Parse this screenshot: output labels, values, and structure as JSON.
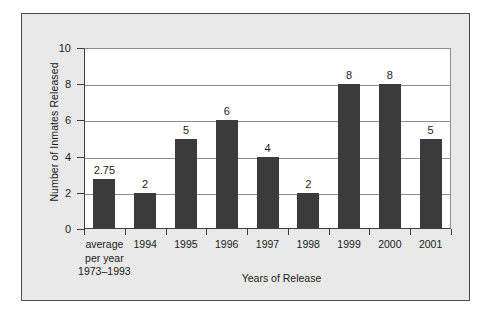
{
  "chart_data": {
    "type": "bar",
    "title": "",
    "xlabel": "Years of Release",
    "ylabel": "Number of Inmates Released",
    "categories": [
      "average\nper year\n1973–1993",
      "1994",
      "1995",
      "1996",
      "1997",
      "1998",
      "1999",
      "2000",
      "2001"
    ],
    "category_lines": [
      [
        "average",
        "per year",
        "1973–1993"
      ],
      [
        "1994"
      ],
      [
        "1995"
      ],
      [
        "1996"
      ],
      [
        "1997"
      ],
      [
        "1998"
      ],
      [
        "1999"
      ],
      [
        "2000"
      ],
      [
        "2001"
      ]
    ],
    "values": [
      2.75,
      2,
      5,
      6,
      4,
      2,
      8,
      8,
      5
    ],
    "value_labels": [
      "2.75",
      "2",
      "5",
      "6",
      "4",
      "2",
      "8",
      "8",
      "5"
    ],
    "ylim": [
      0,
      10
    ],
    "yticks": [
      0,
      2,
      4,
      6,
      8,
      10
    ],
    "ytick_labels": [
      "0",
      "2",
      "4",
      "6",
      "8",
      "10"
    ],
    "grid": true,
    "legend": false,
    "bar_color": "#3b3b3b",
    "plot_background": "#ffffff",
    "figure_background": "#e9e9e9",
    "frame_color": "#4a4a4a",
    "gridline_color": "#8d8d8d",
    "text_color": "#1b1b1b"
  }
}
